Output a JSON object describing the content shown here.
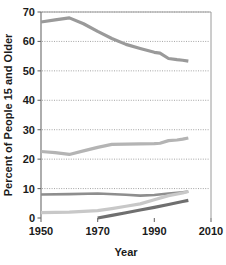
{
  "chart_data": {
    "type": "line",
    "title": "",
    "xlabel": "Year",
    "ylabel": "Percent of People 15 and Older",
    "xlim": [
      1950,
      2010
    ],
    "ylim": [
      0,
      70
    ],
    "xticks": [
      "1950",
      "1970",
      "1990",
      "2010"
    ],
    "yticks": [
      "0",
      "10",
      "20",
      "30",
      "40",
      "50",
      "60",
      "70"
    ],
    "grid": "horizontal-dotted",
    "legend": "none",
    "series": [
      {
        "name": "series-1-top-declining",
        "color": "#9a9a9a",
        "width": 3.2,
        "x": [
          1950,
          1955,
          1960,
          1965,
          1970,
          1975,
          1980,
          1985,
          1990,
          1992,
          1995,
          1998,
          2000,
          2002
        ],
        "values": [
          66.6,
          67.3,
          68.0,
          66.0,
          63.4,
          61.0,
          59.0,
          57.6,
          56.3,
          56.0,
          54.2,
          53.8,
          53.6,
          53.3
        ]
      },
      {
        "name": "series-2-rising-mid",
        "color": "#b4b4b4",
        "width": 3.2,
        "x": [
          1950,
          1955,
          1960,
          1965,
          1970,
          1975,
          1980,
          1985,
          1990,
          1992,
          1995,
          1998,
          2000,
          2002
        ],
        "values": [
          22.6,
          22.2,
          21.6,
          22.8,
          24.0,
          25.0,
          25.1,
          25.2,
          25.3,
          25.4,
          26.3,
          26.5,
          26.8,
          27.2
        ]
      },
      {
        "name": "series-3-flat-near-eight",
        "color": "#8e8e8e",
        "width": 2.6,
        "x": [
          1950,
          1960,
          1970,
          1980,
          1985,
          1990,
          1995,
          2000,
          2002
        ],
        "values": [
          8.0,
          8.1,
          8.3,
          7.9,
          7.6,
          7.8,
          8.3,
          8.7,
          9.0
        ]
      },
      {
        "name": "series-4-rising-light",
        "color": "#c8c8c8",
        "width": 3.2,
        "x": [
          1950,
          1960,
          1970,
          1975,
          1980,
          1985,
          1990,
          1995,
          2000,
          2002
        ],
        "values": [
          1.8,
          2.0,
          2.5,
          3.2,
          4.0,
          4.8,
          6.2,
          7.6,
          8.5,
          9.0
        ]
      },
      {
        "name": "series-5-dark-from-1970",
        "color": "#6f6f6f",
        "width": 3.2,
        "x": [
          1970,
          1975,
          1980,
          1985,
          1990,
          1995,
          2000,
          2002
        ],
        "values": [
          0.0,
          0.9,
          1.8,
          2.7,
          3.6,
          4.6,
          5.6,
          6.0
        ]
      }
    ]
  },
  "axis": {
    "x_title": "Year",
    "y_title": "Percent of People 15 and Older"
  }
}
